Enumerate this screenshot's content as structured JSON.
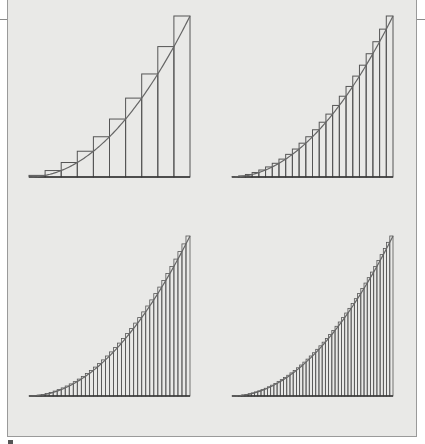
{
  "figure": {
    "background_color": "#e9e9e7",
    "stroke_color": "#555555",
    "curve_color": "#666666"
  },
  "chart_data": [
    {
      "type": "bar",
      "title": "",
      "function": "x^2",
      "interval": [
        0,
        1
      ],
      "rectangles": 10,
      "rule": "right-endpoint upper sum",
      "panel": {
        "x0": 29,
        "x1": 190,
        "baseline": 177,
        "top": 16
      }
    },
    {
      "type": "bar",
      "title": "",
      "function": "x^2",
      "interval": [
        0,
        1
      ],
      "rectangles": 24,
      "rule": "right-endpoint upper sum",
      "panel": {
        "x0": 232,
        "x1": 393,
        "baseline": 177,
        "top": 16
      }
    },
    {
      "type": "bar",
      "title": "",
      "function": "x^2",
      "interval": [
        0,
        1
      ],
      "rectangles": 40,
      "rule": "right-endpoint upper sum",
      "panel": {
        "x0": 29,
        "x1": 190,
        "baseline": 396,
        "top": 236
      }
    },
    {
      "type": "bar",
      "title": "",
      "function": "x^2",
      "interval": [
        0,
        1
      ],
      "rectangles": 50,
      "rule": "right-endpoint upper sum",
      "panel": {
        "x0": 232,
        "x1": 393,
        "baseline": 396,
        "top": 236
      }
    }
  ]
}
